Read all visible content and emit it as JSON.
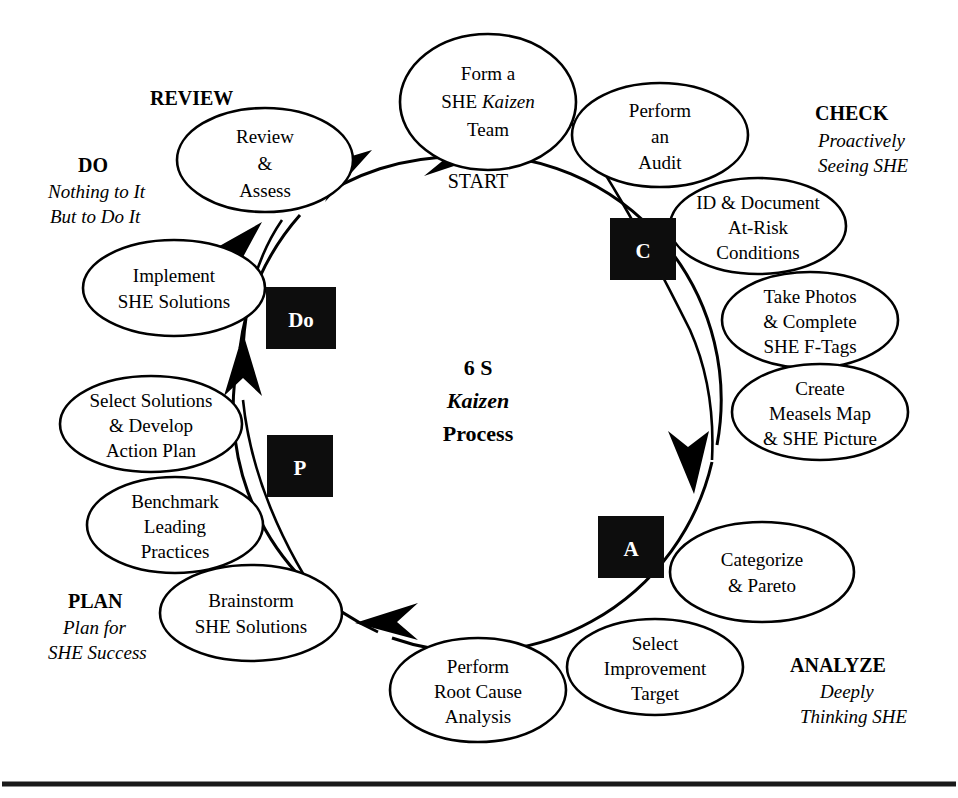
{
  "diagram": {
    "center_title": {
      "line1": "6 S",
      "line2": "Kaizen",
      "line3": "Process"
    },
    "start_label": "START"
  },
  "phases": [
    {
      "key": "review",
      "head": "REVIEW",
      "sub1": "",
      "sub2": ""
    },
    {
      "key": "check",
      "head": "CHECK",
      "sub1": "Proactively",
      "sub2": "Seeing SHE"
    },
    {
      "key": "analyze",
      "head": "ANALYZE",
      "sub1": "Deeply",
      "sub2": "Thinking SHE"
    },
    {
      "key": "plan",
      "head": "PLAN",
      "sub1": "Plan for",
      "sub2": "SHE Success"
    },
    {
      "key": "do",
      "head": "DO",
      "sub1": "Nothing to It",
      "sub2": "But to Do It"
    }
  ],
  "badges": [
    {
      "key": "c",
      "label": "C"
    },
    {
      "key": "a",
      "label": "A"
    },
    {
      "key": "p",
      "label": "P"
    },
    {
      "key": "do",
      "label": "Do"
    }
  ],
  "steps": [
    {
      "key": "form-team",
      "l1": "Form a",
      "l2": "SHE Kaizen",
      "l3": "Team",
      "italic_word": "Kaizen"
    },
    {
      "key": "perform-audit",
      "l1": "Perform",
      "l2": "an",
      "l3": "Audit",
      "italic_word": ""
    },
    {
      "key": "id-document",
      "l1": "ID & Document",
      "l2": "At-Risk",
      "l3": "Conditions",
      "italic_word": ""
    },
    {
      "key": "take-photos",
      "l1": "Take Photos",
      "l2": "& Complete",
      "l3": "SHE F-Tags",
      "italic_word": ""
    },
    {
      "key": "measels-map",
      "l1": "Create",
      "l2": "Measels Map",
      "l3": "& SHE Picture",
      "italic_word": ""
    },
    {
      "key": "categorize",
      "l1": "Categorize",
      "l2": "& Pareto",
      "l3": "",
      "italic_word": ""
    },
    {
      "key": "select-target",
      "l1": "Select",
      "l2": "Improvement",
      "l3": "Target",
      "italic_word": ""
    },
    {
      "key": "root-cause",
      "l1": "Perform",
      "l2": "Root Cause",
      "l3": "Analysis",
      "italic_word": ""
    },
    {
      "key": "brainstorm",
      "l1": "Brainstorm",
      "l2": "SHE Solutions",
      "l3": "",
      "italic_word": ""
    },
    {
      "key": "benchmark",
      "l1": "Benchmark",
      "l2": "Leading",
      "l3": "Practices",
      "italic_word": ""
    },
    {
      "key": "select-develop",
      "l1": "Select Solutions",
      "l2": "& Develop",
      "l3": "Action Plan",
      "italic_word": ""
    },
    {
      "key": "implement",
      "l1": "Implement",
      "l2": "SHE Solutions",
      "l3": "",
      "italic_word": ""
    },
    {
      "key": "review-assess",
      "l1": "Review",
      "l2": "&",
      "l3": "Assess",
      "italic_word": ""
    }
  ],
  "colors": {
    "stroke": "#000000",
    "badge_bg": "#0d0d0d",
    "badge_fg": "#ffffff",
    "background": "#ffffff"
  }
}
